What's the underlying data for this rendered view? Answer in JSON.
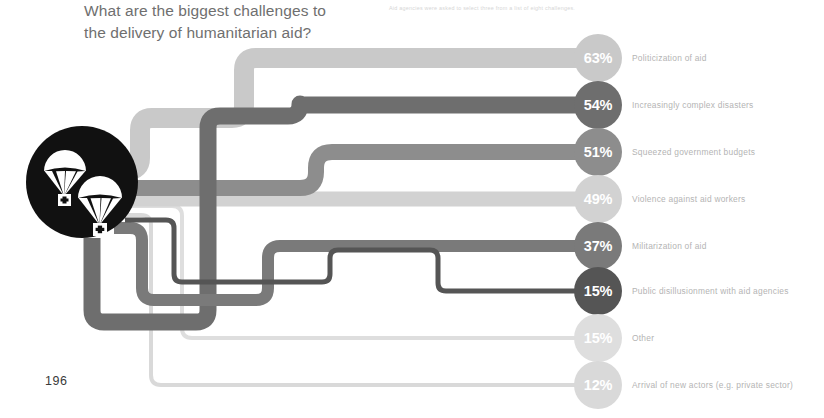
{
  "page": {
    "number": "196",
    "background": "#ffffff"
  },
  "headline": {
    "line1": "What are the biggest challenges to",
    "line2": "the delivery of humanitarian aid?",
    "color": "#6f6f6f"
  },
  "subhead": {
    "text": "Aid agencies were asked to select three from a list of eight challenges.",
    "color": "#d6d6d6"
  },
  "hub": {
    "icon": "parachute-aid-drop-icon",
    "color": "#111111",
    "cx": 82,
    "cy": 182,
    "r": 56
  },
  "chart_data": {
    "type": "bar",
    "title": "What are the biggest challenges to the delivery of humanitarian aid?",
    "subtitle": "Aid agencies were asked to select three from a list of eight challenges.",
    "xlabel": "",
    "ylabel": "",
    "unit": "%",
    "grid": false,
    "legend": "none",
    "xlim": [
      0,
      63
    ],
    "categories": [
      "Politicization of aid",
      "Increasingly complex disasters",
      "Squeezed government budgets",
      "Violence against aid workers",
      "Militarization of aid",
      "Public disillusionment with aid agencies",
      "Other",
      "Arrival of new actors (e.g. private sector)"
    ],
    "values": [
      63,
      54,
      51,
      49,
      37,
      15,
      15,
      12
    ],
    "labels": [
      "63%",
      "54%",
      "51%",
      "49%",
      "37%",
      "15%",
      "15%",
      "12%"
    ],
    "colors": [
      "#c9c9c9",
      "#6e6e6e",
      "#8d8d8d",
      "#d2d2d2",
      "#7a7a7a",
      "#555555",
      "#dedede",
      "#d9d9d9"
    ]
  },
  "rows": [
    {
      "pct": "63%",
      "value": 63,
      "label": "Politicization of aid",
      "color": "#c9c9c9",
      "cy": 58,
      "ribbon": 20
    },
    {
      "pct": "54%",
      "value": 54,
      "label": "Increasingly complex disasters",
      "color": "#6e6e6e",
      "cy": 105,
      "ribbon": 17
    },
    {
      "pct": "51%",
      "value": 51,
      "label": "Squeezed government budgets",
      "color": "#8d8d8d",
      "cy": 152,
      "ribbon": 16
    },
    {
      "pct": "49%",
      "value": 49,
      "label": "Violence against aid workers",
      "color": "#d2d2d2",
      "cy": 199,
      "ribbon": 15
    },
    {
      "pct": "37%",
      "value": 37,
      "label": "Militarization of aid",
      "color": "#7a7a7a",
      "cy": 246,
      "ribbon": 12
    },
    {
      "pct": "15%",
      "value": 15,
      "label": "Public disillusionment with aid agencies",
      "color": "#555555",
      "cy": 291,
      "ribbon": 5
    },
    {
      "pct": "15%",
      "value": 15,
      "label": "Other",
      "color": "#dedede",
      "cy": 338,
      "ribbon": 4
    },
    {
      "pct": "12%",
      "value": 12,
      "label": "Arrival of new actors (e.g. private sector)",
      "color": "#d9d9d9",
      "cy": 385,
      "ribbon": 4
    }
  ]
}
